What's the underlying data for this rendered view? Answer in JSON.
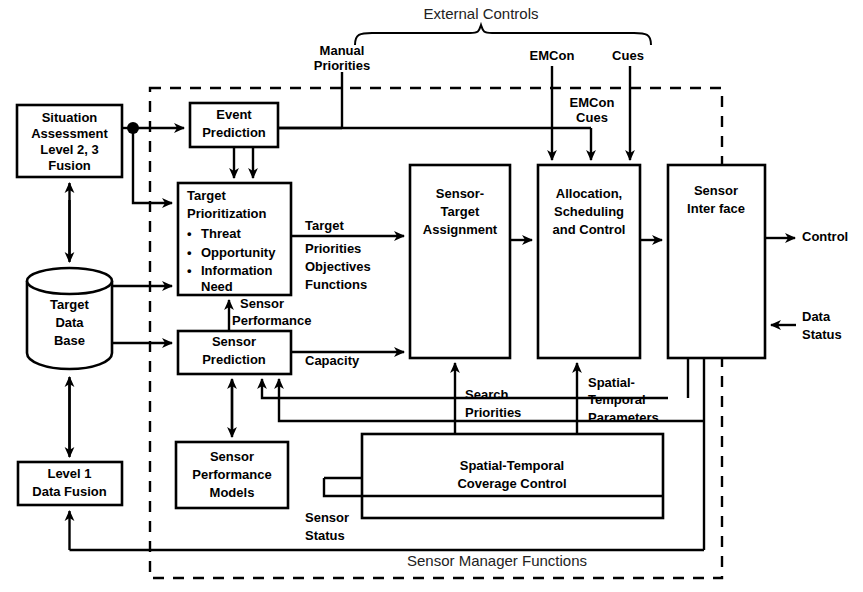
{
  "figure": {
    "title": "External Controls",
    "frame_label": "Sensor Manager Functions"
  },
  "external_inputs": [
    {
      "id": "manual-priorities",
      "line1": "Manual",
      "line2": "Priorities"
    },
    {
      "id": "emcon",
      "line1": "EMCon",
      "line2": ""
    },
    {
      "id": "cues",
      "line1": "Cues",
      "line2": ""
    }
  ],
  "internal_labels": {
    "emcon_cues_line1": "EMCon",
    "emcon_cues_line2": "Cues"
  },
  "nodes": {
    "situation_assessment": {
      "line1": "Situation",
      "line2": "Assessment",
      "line3": "Level 2, 3",
      "line4": "Fusion"
    },
    "target_data_base": {
      "line1": "Target",
      "line2": "Data",
      "line3": "Base"
    },
    "level1_data_fusion": {
      "line1": "Level 1",
      "line2": "Data Fusion"
    },
    "event_prediction": {
      "line1": "Event",
      "line2": "Prediction"
    },
    "target_prioritization": {
      "line1": "Target",
      "line2": "Prioritization",
      "bullets": [
        "Threat",
        "Opportunity",
        "Information"
      ],
      "bullet_cont": "Need"
    },
    "sensor_prediction": {
      "line1": "Sensor",
      "line2": "Prediction"
    },
    "sensor_performance_models": {
      "line1": "Sensor",
      "line2": "Performance",
      "line3": "Models"
    },
    "sensor_target_assignment": {
      "line1": "Sensor-",
      "line2": "Target",
      "line3": "Assignment"
    },
    "allocation_scheduling_control": {
      "line1": "Allocation,",
      "line2": "Scheduling",
      "line3": "and Control"
    },
    "sensor_interface": {
      "line1": "Sensor",
      "line2": "Inter face"
    },
    "spatial_temporal_coverage_control": {
      "line1": "Spatial-Temporal",
      "line2": "Coverage Control"
    }
  },
  "edge_labels": {
    "target": "Target",
    "priorities": "Priorities",
    "objectives": "Objectives",
    "functions": "Functions",
    "sensor_performance_l1": "Sensor",
    "sensor_performance_l2": "Performance",
    "capacity": "Capacity",
    "search_priorities_l1": "Search",
    "search_priorities_l2": "Priorities",
    "spatial_temporal_parameters_l1": "Spatial-",
    "spatial_temporal_parameters_l2": "Temporal",
    "spatial_temporal_parameters_l3": "Parameters",
    "sensor_status_l1": "Sensor",
    "sensor_status_l2": "Status",
    "control": "Control",
    "data_l1": "Data",
    "data_l2": "Status"
  },
  "colors": {
    "stroke": "#000000",
    "background": "#ffffff",
    "label_light": "#222222"
  }
}
